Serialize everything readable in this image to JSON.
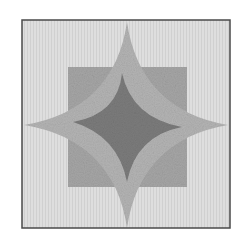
{
  "image": {
    "subject": "quilt-block-four-point-star",
    "colors": {
      "page_background": "#ffffff",
      "frame_border": "#4a4a4a",
      "background_fabric": "#dcdcdc",
      "square_fabric": "#a6a6a6",
      "outer_star_fabric": "#b2b2b2",
      "inner_star_fabric": "#7c7c7c"
    },
    "frame": {
      "x": 22,
      "y": 20,
      "width": 208,
      "height": 208
    },
    "center_square": {
      "x": 68,
      "y": 67,
      "width": 119,
      "height": 120
    },
    "outer_star_tips": {
      "top": [
        127,
        22
      ],
      "right": [
        228,
        125
      ],
      "bottom": [
        127,
        228
      ],
      "left": [
        24,
        125
      ]
    },
    "inner_star_tips": {
      "top": [
        122,
        73
      ],
      "right": [
        182,
        127
      ],
      "bottom": [
        127,
        182
      ],
      "left": [
        73,
        122
      ]
    }
  }
}
